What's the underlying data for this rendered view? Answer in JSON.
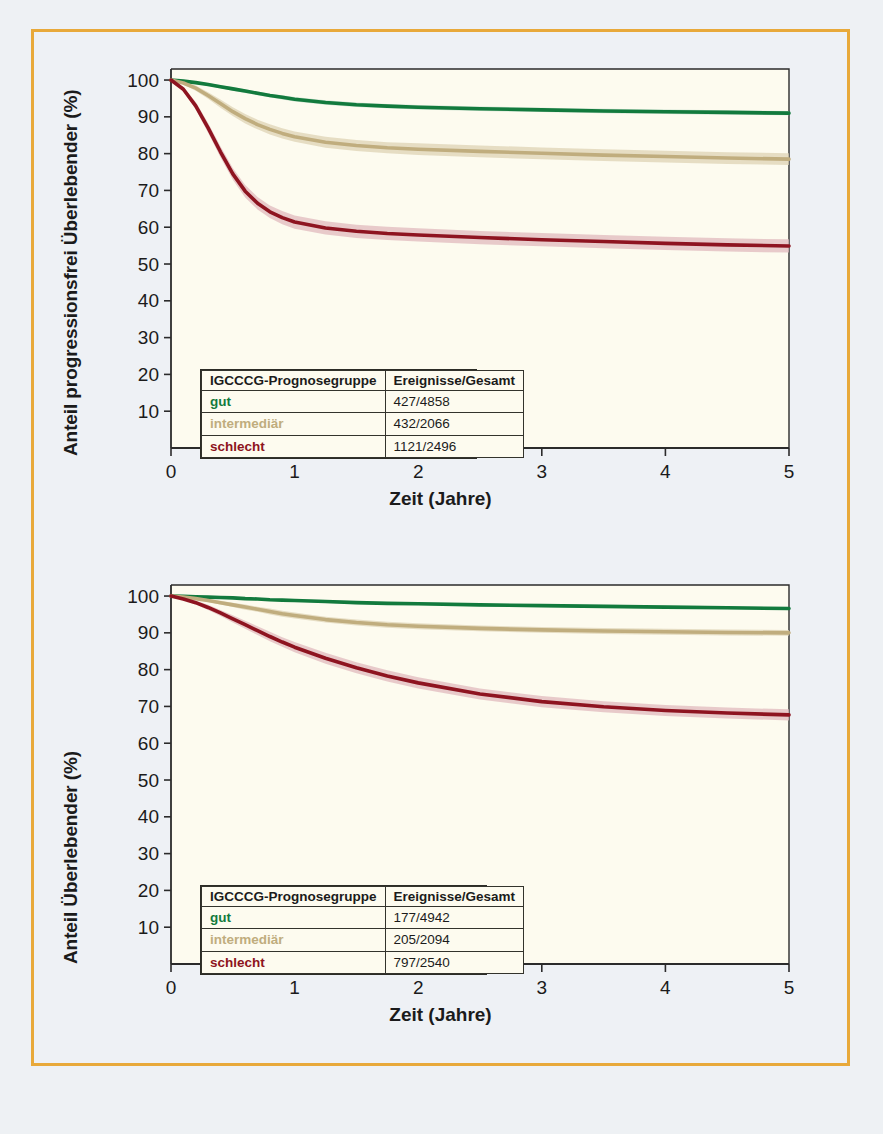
{
  "figure": {
    "border_color": "#e8a93a",
    "background_color": "#eef1f5",
    "caption": ""
  },
  "colors": {
    "gut": "#127a3d",
    "intermediaer": "#c0ad7e",
    "schlecht": "#8e1420",
    "gut_band": "#bcd9c6",
    "intermediaer_band": "#ded3b4",
    "schlecht_band": "#e0b9bd",
    "axis": "#2b2b2b",
    "plot_background": "#fdfbef"
  },
  "panels": [
    {
      "id": "pfs",
      "ylabel": "Anteil progressionsfrei Überlebender (%)",
      "xlabel": "Zeit (Jahre)",
      "legend": {
        "headers": [
          "IGCCCG-Prognosegruppe",
          "Ereignisse/Gesamt"
        ],
        "rows": [
          {
            "group": "gut",
            "events": "427/4858"
          },
          {
            "group": "intermediär",
            "events": "432/2066"
          },
          {
            "group": "schlecht",
            "events": "1121/2496"
          }
        ]
      }
    },
    {
      "id": "os",
      "ylabel": "Anteil Überlebender (%)",
      "xlabel": "Zeit (Jahre)",
      "legend": {
        "headers": [
          "IGCCCG-Prognosegruppe",
          "Ereignisse/Gesamt"
        ],
        "rows": [
          {
            "group": "gut",
            "events": "177/4942"
          },
          {
            "group": "intermediär",
            "events": "205/2094"
          },
          {
            "group": "schlecht",
            "events": "797/2540"
          }
        ]
      }
    }
  ],
  "chart_data": [
    {
      "type": "line",
      "title": "Progressionsfreies Überleben nach IGCCCG-Prognosegruppe",
      "xlabel": "Zeit (Jahre)",
      "ylabel": "Anteil progressionsfrei Überlebender (%)",
      "xlim": [
        0,
        5
      ],
      "ylim": [
        0,
        103
      ],
      "xticks": [
        0,
        1,
        2,
        3,
        4,
        5
      ],
      "yticks": [
        10,
        20,
        30,
        40,
        50,
        60,
        70,
        80,
        90,
        100
      ],
      "grid": false,
      "legend_position": "inside-lower-left",
      "x": [
        0,
        0.1,
        0.2,
        0.3,
        0.4,
        0.5,
        0.6,
        0.7,
        0.8,
        0.9,
        1.0,
        1.25,
        1.5,
        1.75,
        2.0,
        2.5,
        3.0,
        3.5,
        4.0,
        4.5,
        5.0
      ],
      "series": [
        {
          "name": "gut",
          "label": "gut",
          "color": "#127a3d",
          "events_total": "427/4858",
          "values": [
            100,
            99.7,
            99.3,
            98.8,
            98.2,
            97.6,
            97.0,
            96.4,
            95.8,
            95.3,
            94.8,
            93.9,
            93.3,
            92.9,
            92.6,
            92.2,
            91.9,
            91.6,
            91.4,
            91.2,
            91.0
          ],
          "ci_lower": [
            100,
            99.5,
            99.0,
            98.4,
            97.8,
            97.1,
            96.5,
            95.9,
            95.3,
            94.7,
            94.2,
            93.3,
            92.7,
            92.3,
            92.0,
            91.6,
            91.3,
            91.0,
            90.8,
            90.6,
            90.4
          ],
          "ci_upper": [
            100,
            99.9,
            99.6,
            99.2,
            98.6,
            98.1,
            97.5,
            96.9,
            96.3,
            95.9,
            95.4,
            94.5,
            93.9,
            93.5,
            93.2,
            92.8,
            92.5,
            92.2,
            92.0,
            91.8,
            91.6
          ]
        },
        {
          "name": "intermediaer",
          "label": "intermediär",
          "color": "#c0ad7e",
          "events_total": "432/2066",
          "values": [
            100,
            99.2,
            97.8,
            95.8,
            93.6,
            91.4,
            89.5,
            87.9,
            86.6,
            85.5,
            84.6,
            83.1,
            82.2,
            81.6,
            81.2,
            80.6,
            80.1,
            79.6,
            79.2,
            78.8,
            78.5
          ],
          "ci_lower": [
            100,
            98.8,
            97.1,
            94.9,
            92.5,
            90.2,
            88.2,
            86.6,
            85.2,
            84.1,
            83.2,
            81.6,
            80.7,
            80.1,
            79.6,
            79.0,
            78.5,
            78.0,
            77.6,
            77.2,
            76.9
          ],
          "ci_upper": [
            100,
            99.6,
            98.5,
            96.7,
            94.7,
            92.6,
            90.8,
            89.2,
            88.0,
            86.9,
            86.0,
            84.6,
            83.7,
            83.1,
            82.8,
            82.2,
            81.7,
            81.2,
            80.8,
            80.4,
            80.1
          ]
        },
        {
          "name": "schlecht",
          "label": "schlecht",
          "color": "#8e1420",
          "events_total": "1121/2496",
          "values": [
            100,
            97.5,
            93.0,
            87.0,
            80.5,
            74.5,
            69.8,
            66.5,
            64.2,
            62.6,
            61.4,
            59.8,
            58.9,
            58.3,
            57.9,
            57.2,
            56.6,
            56.1,
            55.6,
            55.2,
            54.9
          ],
          "ci_lower": [
            100,
            96.9,
            92.0,
            85.7,
            79.0,
            72.9,
            68.1,
            64.8,
            62.5,
            60.8,
            59.6,
            58.0,
            57.1,
            56.5,
            56.1,
            55.4,
            54.8,
            54.3,
            53.8,
            53.4,
            53.1
          ],
          "ci_upper": [
            100,
            98.1,
            94.0,
            88.3,
            82.0,
            76.1,
            71.5,
            68.2,
            65.9,
            64.4,
            63.2,
            61.6,
            60.7,
            60.1,
            59.7,
            59.0,
            58.4,
            57.9,
            57.4,
            57.0,
            56.7
          ]
        }
      ]
    },
    {
      "type": "line",
      "title": "Gesamtüberleben nach IGCCCG-Prognosegruppe",
      "xlabel": "Zeit (Jahre)",
      "ylabel": "Anteil Überlebender (%)",
      "xlim": [
        0,
        5
      ],
      "ylim": [
        0,
        103
      ],
      "xticks": [
        0,
        1,
        2,
        3,
        4,
        5
      ],
      "yticks": [
        10,
        20,
        30,
        40,
        50,
        60,
        70,
        80,
        90,
        100
      ],
      "grid": false,
      "legend_position": "inside-lower-left",
      "x": [
        0,
        0.1,
        0.2,
        0.3,
        0.4,
        0.5,
        0.6,
        0.7,
        0.8,
        0.9,
        1.0,
        1.25,
        1.5,
        1.75,
        2.0,
        2.5,
        3.0,
        3.5,
        4.0,
        4.5,
        5.0
      ],
      "series": [
        {
          "name": "gut",
          "label": "gut",
          "color": "#127a3d",
          "events_total": "177/4942",
          "values": [
            100,
            99.9,
            99.8,
            99.7,
            99.6,
            99.5,
            99.3,
            99.2,
            99.0,
            98.9,
            98.8,
            98.5,
            98.2,
            98.0,
            97.9,
            97.6,
            97.4,
            97.2,
            97.0,
            96.8,
            96.6
          ],
          "ci_lower": [
            100,
            99.8,
            99.6,
            99.5,
            99.4,
            99.2,
            99.0,
            98.9,
            98.7,
            98.6,
            98.5,
            98.1,
            97.8,
            97.6,
            97.5,
            97.2,
            97.0,
            96.8,
            96.6,
            96.4,
            96.2
          ],
          "ci_upper": [
            100,
            100,
            100,
            99.9,
            99.8,
            99.8,
            99.6,
            99.5,
            99.3,
            99.2,
            99.1,
            98.9,
            98.6,
            98.4,
            98.3,
            98.0,
            97.8,
            97.6,
            97.4,
            97.2,
            97.0
          ]
        },
        {
          "name": "intermediaer",
          "label": "intermediär",
          "color": "#c0ad7e",
          "events_total": "205/2094",
          "values": [
            100,
            99.7,
            99.3,
            98.8,
            98.2,
            97.6,
            97.0,
            96.4,
            95.8,
            95.2,
            94.7,
            93.6,
            92.8,
            92.2,
            91.8,
            91.2,
            90.8,
            90.5,
            90.3,
            90.1,
            90.0
          ],
          "ci_lower": [
            100,
            99.5,
            99.0,
            98.4,
            97.7,
            97.0,
            96.3,
            95.7,
            95.0,
            94.4,
            93.9,
            92.8,
            92.0,
            91.4,
            91.0,
            90.4,
            90.0,
            89.7,
            89.5,
            89.3,
            89.2
          ],
          "ci_upper": [
            100,
            99.9,
            99.6,
            99.2,
            98.7,
            98.2,
            97.7,
            97.1,
            96.6,
            96.0,
            95.5,
            94.4,
            93.6,
            93.0,
            92.6,
            92.0,
            91.6,
            91.3,
            91.1,
            90.9,
            90.8
          ]
        },
        {
          "name": "schlecht",
          "label": "schlecht",
          "color": "#8e1420",
          "events_total": "797/2540",
          "values": [
            100,
            99.2,
            98.2,
            96.9,
            95.4,
            93.8,
            92.2,
            90.6,
            89.0,
            87.5,
            86.1,
            83.1,
            80.5,
            78.3,
            76.4,
            73.4,
            71.3,
            69.9,
            68.9,
            68.2,
            67.7
          ],
          "ci_lower": [
            100,
            98.9,
            97.7,
            96.2,
            94.6,
            92.8,
            91.1,
            89.4,
            87.7,
            86.2,
            84.7,
            81.6,
            79.0,
            76.8,
            74.9,
            71.9,
            69.8,
            68.4,
            67.4,
            66.7,
            66.2
          ],
          "ci_upper": [
            100,
            99.5,
            98.7,
            97.6,
            96.2,
            94.8,
            93.3,
            91.8,
            90.3,
            88.8,
            87.5,
            84.6,
            82.0,
            79.8,
            77.9,
            74.9,
            72.8,
            71.4,
            70.4,
            69.7,
            69.2
          ]
        }
      ]
    }
  ]
}
